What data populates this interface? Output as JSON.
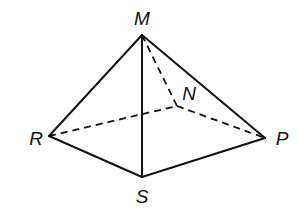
{
  "figure": {
    "type": "pyramid",
    "width": 299,
    "height": 216,
    "stroke_color": "#111111",
    "background_color": "#ffffff",
    "vertices": [
      {
        "id": "M",
        "label": "M",
        "x": 142,
        "y": 35,
        "label_x": 142,
        "label_y": 25,
        "anchor": "middle"
      },
      {
        "id": "N",
        "label": "N",
        "x": 177,
        "y": 106,
        "label_x": 189,
        "label_y": 100,
        "anchor": "middle"
      },
      {
        "id": "R",
        "label": "R",
        "x": 49,
        "y": 136,
        "label_x": 36,
        "label_y": 145,
        "anchor": "middle"
      },
      {
        "id": "P",
        "label": "P",
        "x": 265,
        "y": 138,
        "label_x": 282,
        "label_y": 145,
        "anchor": "middle"
      },
      {
        "id": "S",
        "label": "S",
        "x": 142,
        "y": 177,
        "label_x": 142,
        "label_y": 203,
        "anchor": "middle"
      }
    ],
    "edges": [
      {
        "from": "M",
        "to": "R",
        "style": "solid"
      },
      {
        "from": "M",
        "to": "P",
        "style": "solid"
      },
      {
        "from": "M",
        "to": "S",
        "style": "solid"
      },
      {
        "from": "R",
        "to": "S",
        "style": "solid"
      },
      {
        "from": "S",
        "to": "P",
        "style": "solid"
      },
      {
        "from": "M",
        "to": "N",
        "style": "dashed"
      },
      {
        "from": "R",
        "to": "N",
        "style": "dashed"
      },
      {
        "from": "N",
        "to": "P",
        "style": "dashed"
      }
    ]
  }
}
